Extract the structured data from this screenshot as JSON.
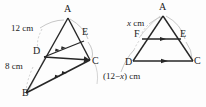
{
  "figure": {
    "background_color": "#fdfdfd",
    "stroke_color": "#262626",
    "leader_color": "#9a9a9a",
    "arc_color": "#b5b5b5"
  },
  "left_diagram": {
    "name": "triangle-abc-left",
    "vertices": [
      {
        "key": "A",
        "label": "A",
        "x": 68,
        "y": 16
      },
      {
        "key": "B",
        "label": "B",
        "x": 26,
        "y": 95
      },
      {
        "key": "C",
        "label": "C",
        "x": 91,
        "y": 60
      },
      {
        "key": "D",
        "label": "D",
        "x": 43,
        "y": 56
      },
      {
        "key": "E",
        "label": "E",
        "x": 85,
        "y": 38
      }
    ],
    "measures": [
      {
        "key": "AD",
        "text": "12 cm",
        "x": 11,
        "y": 26
      },
      {
        "key": "DB",
        "text": "8 cm",
        "x": 5,
        "y": 64
      }
    ],
    "arrow_marks": [
      {
        "segment": "DE",
        "ticks": 2
      },
      {
        "segment": "BC",
        "ticks": 2
      }
    ]
  },
  "right_diagram": {
    "name": "triangle-adc-right",
    "vertices": [
      {
        "key": "A",
        "label": "A",
        "x": 163,
        "y": 13
      },
      {
        "key": "F",
        "label": "F",
        "x": 141,
        "y": 39
      },
      {
        "key": "E",
        "label": "E",
        "x": 181,
        "y": 39
      },
      {
        "key": "D",
        "label": "D",
        "x": 133,
        "y": 62
      },
      {
        "key": "C",
        "label": "C",
        "x": 192,
        "y": 62
      }
    ],
    "measures": [
      {
        "key": "AF",
        "text_html": "<i>x</i> cm",
        "text": "x cm",
        "x": 127,
        "y": 21
      },
      {
        "key": "FD",
        "text_html": "(12&#8722;<i>x</i>) cm",
        "text": "(12-x) cm",
        "x": 103,
        "y": 74
      }
    ],
    "arrow_marks": [
      {
        "segment": "FE",
        "ticks": 1
      },
      {
        "segment": "DC",
        "ticks": 1
      }
    ]
  }
}
